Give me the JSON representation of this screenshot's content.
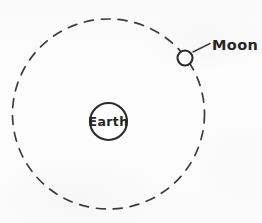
{
  "figure": {
    "kind": "astronomy-orbit-diagram",
    "background_color": "#fdfdfd",
    "ink_color": "#2b2b2b",
    "labels": {
      "earth": "Earth",
      "moon": "Moon"
    },
    "bodies": [
      {
        "id": "earth",
        "label": "Earth",
        "role": "central-body",
        "center_x": 108.5,
        "center_y": 121.5,
        "radius": 18.5,
        "fill": "#ffffff",
        "stroke": "#2b2b2b",
        "stroke_width": 2.1
      },
      {
        "id": "moon",
        "label": "Moon",
        "role": "orbiting-body",
        "center_x": 185,
        "center_y": 58,
        "radius": 7.5,
        "fill": "#ffffff",
        "stroke": "#2b2b2b",
        "stroke_width": 2.1
      }
    ],
    "orbit": {
      "id": "moon-orbit",
      "style": "dashed",
      "center_x": 108.5,
      "center_y": 114,
      "radius_x": 96,
      "radius_y": 95,
      "dash_length": 9,
      "gap_length": 8,
      "stroke_width": 1.7,
      "stroke": "#2b2b2b"
    },
    "leader": {
      "id": "moon-leader-line",
      "from_x": 193,
      "from_y": 52,
      "to_x": 210,
      "to_y": 43.5,
      "stroke_width": 1.5
    },
    "label_positions": {
      "earth": {
        "x": 108.5,
        "y": 126
      },
      "moon": {
        "x": 212,
        "y": 50
      }
    }
  }
}
